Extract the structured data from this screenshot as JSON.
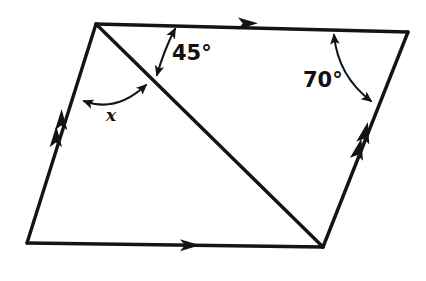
{
  "figure": {
    "shape_type": "parallelogram",
    "background_color": "#ffffff",
    "line_color": "#141414",
    "labels": {
      "angle_45": "45°",
      "angle_70": "70°",
      "unknown_angle": "x"
    },
    "label_positions": {
      "angle_45": {
        "x": 172,
        "y": 60
      },
      "angle_70": {
        "x": 303,
        "y": 87
      },
      "unknown_angle": {
        "x": 106,
        "y": 121
      }
    },
    "vertices": {
      "top_left": {
        "x": 96,
        "y": 24
      },
      "top_right": {
        "x": 408,
        "y": 32
      },
      "bottom_right": {
        "x": 323,
        "y": 247
      },
      "bottom_left": {
        "x": 27,
        "y": 243
      }
    },
    "diagonal": {
      "from": "top_left",
      "to": "bottom_right",
      "start": {
        "x": 96,
        "y": 24
      },
      "end": {
        "x": 323,
        "y": 247
      }
    },
    "edge_tick_marks": {
      "top_edge": {
        "count": 1,
        "direction": "right"
      },
      "bottom_edge": {
        "count": 1,
        "direction": "right"
      },
      "left_edge": {
        "count": 2,
        "direction": "up"
      },
      "right_edge": {
        "count": 2,
        "direction": "up"
      }
    },
    "angle_arcs": [
      {
        "name": "arc-45",
        "label": "45°",
        "from_point": {
          "x": 174,
          "y": 28
        },
        "to_point": {
          "x": 156,
          "y": 76
        },
        "arrowheads": "both"
      },
      {
        "name": "arc-70",
        "label": "70°",
        "from_point": {
          "x": 333,
          "y": 34
        },
        "to_point": {
          "x": 372,
          "y": 102
        },
        "arrowheads": "both"
      },
      {
        "name": "arc-x",
        "label": "x",
        "from_point": {
          "x": 83,
          "y": 101
        },
        "to_point": {
          "x": 147,
          "y": 84
        },
        "arrowheads": "both"
      }
    ]
  }
}
